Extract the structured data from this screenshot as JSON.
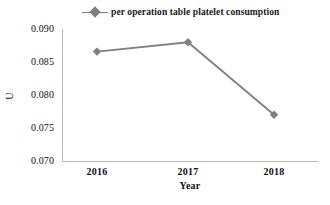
{
  "chart_data": {
    "type": "line",
    "title": "",
    "xlabel": "Year",
    "ylabel": "U",
    "categories": [
      "2016",
      "2017",
      "2018"
    ],
    "series": [
      {
        "name": "per operation table platelet consumption",
        "values": [
          0.0866,
          0.088,
          0.0771
        ],
        "color": "#7f7f7f",
        "marker": "diamond"
      }
    ],
    "ylim": [
      0.07,
      0.09
    ],
    "yticks": [
      "0.070",
      "0.075",
      "0.080",
      "0.085",
      "0.090"
    ],
    "ytick_values": [
      0.07,
      0.075,
      0.08,
      0.085,
      0.09
    ],
    "grid": false,
    "legend_position": "top-center"
  },
  "legend": {
    "entries": [
      {
        "label": "per operation table platelet consumption",
        "marker_icon": "diamond-marker-icon",
        "color": "#7f7f7f"
      }
    ]
  },
  "axes": {
    "x": {
      "title": "Year",
      "ticks": [
        "2016",
        "2017",
        "2018"
      ]
    },
    "y": {
      "title": "U",
      "ticks": [
        "0.070",
        "0.075",
        "0.080",
        "0.085",
        "0.090"
      ]
    }
  },
  "colors": {
    "series": "#7f7f7f",
    "axis": "#b9b9b9",
    "text": "#111111",
    "background": "#ffffff"
  }
}
